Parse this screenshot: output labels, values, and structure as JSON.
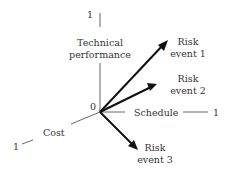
{
  "diagram": {
    "origin_label": "0",
    "axes": {
      "technical_performance": {
        "label_line1": "Technical",
        "label_line2": "performance",
        "end_label": "1"
      },
      "schedule": {
        "label": "Schedule",
        "end_label": "1"
      },
      "cost": {
        "label": "Cost",
        "end_label": "1"
      }
    },
    "risk_events": [
      {
        "line1": "Risk",
        "line2": "event 1"
      },
      {
        "line1": "Risk",
        "line2": "event 2"
      },
      {
        "line1": "Risk",
        "line2": "event 3"
      }
    ],
    "colors": {
      "axis": "#555555",
      "arrow": "#111111",
      "text": "#333333"
    }
  }
}
